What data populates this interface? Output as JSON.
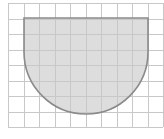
{
  "diagram": {
    "type": "grid-shape",
    "grid": {
      "columns": 10,
      "rows": 8,
      "cell_size_px": 15.5,
      "origin_px": [
        8,
        3
      ],
      "line_color": "#c8c8c8",
      "line_width": 1
    },
    "shape": {
      "fill_color": "#dddddd",
      "stroke_color": "#8a8a8a",
      "stroke_width": 1.6,
      "top_y_px": 18,
      "left_x_px": 24,
      "right_x_px": 148,
      "arc_center_y_px": 52,
      "arc_radius_px": 62,
      "grid_units": {
        "width": 8,
        "rect_height": 2.2,
        "radius": 4
      }
    }
  }
}
